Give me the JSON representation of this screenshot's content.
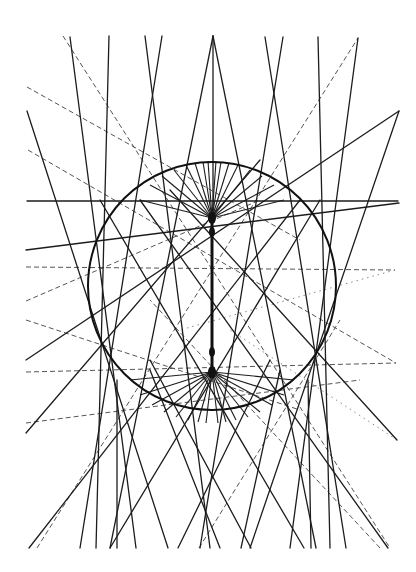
{
  "figure": {
    "colors": {
      "background": "#ffffff",
      "line": "#1c1c1c",
      "dashed_line": "#555555",
      "dotted_line": "#8a8a8a"
    },
    "circle": {
      "cx": 212,
      "cy": 286,
      "r": 124
    },
    "spine": {
      "x": 212,
      "y1": 218,
      "y2": 372
    },
    "nodes": [
      {
        "x": 212,
        "y": 218,
        "r": 4
      },
      {
        "x": 212,
        "y": 232,
        "r": 3
      },
      {
        "x": 212,
        "y": 352,
        "r": 3
      },
      {
        "x": 212,
        "y": 372,
        "r": 4
      }
    ],
    "solid_lines": [
      [
        70,
        37,
        136,
        548
      ],
      [
        109,
        36,
        96,
        548
      ],
      [
        145,
        36,
        210,
        548
      ],
      [
        162,
        36,
        80,
        548
      ],
      [
        213,
        36,
        110,
        548
      ],
      [
        213,
        36,
        316,
        548
      ],
      [
        213,
        36,
        213,
        218
      ],
      [
        265,
        37,
        346,
        548
      ],
      [
        283,
        37,
        200,
        548
      ],
      [
        318,
        37,
        330,
        548
      ],
      [
        358,
        38,
        290,
        548
      ],
      [
        27,
        111,
        168,
        548
      ],
      [
        399,
        111,
        250,
        548
      ],
      [
        27,
        201,
        398,
        201
      ],
      [
        26,
        250,
        399,
        203
      ],
      [
        26,
        360,
        399,
        111
      ],
      [
        26,
        433,
        260,
        160
      ],
      [
        29,
        548,
        300,
        200
      ],
      [
        388,
        548,
        140,
        200
      ],
      [
        397,
        440,
        170,
        190
      ],
      [
        110,
        548,
        320,
        200
      ],
      [
        304,
        548,
        100,
        200
      ],
      [
        117,
        548,
        117,
        380
      ],
      [
        311,
        548,
        308,
        380
      ],
      [
        220,
        548,
        150,
        370
      ],
      [
        241,
        548,
        280,
        370
      ],
      [
        178,
        548,
        270,
        360
      ],
      [
        251,
        548,
        150,
        360
      ]
    ],
    "dashed_lines": [
      [
        63,
        36,
        390,
        548
      ],
      [
        27,
        87,
        300,
        240
      ],
      [
        28,
        150,
        396,
        363
      ],
      [
        26,
        267,
        395,
        270
      ],
      [
        26,
        301,
        260,
        200
      ],
      [
        26,
        320,
        300,
        410
      ],
      [
        26,
        372,
        396,
        363
      ],
      [
        26,
        423,
        360,
        380
      ],
      [
        37,
        548,
        358,
        38
      ],
      [
        380,
        548,
        150,
        300
      ],
      [
        199,
        548,
        340,
        320
      ]
    ],
    "dotted_lines": [
      [
        395,
        270,
        180,
        330
      ],
      [
        397,
        440,
        230,
        330
      ]
    ],
    "top_fan": {
      "origin": [
        212,
        218
      ],
      "targets": [
        [
          140,
          200
        ],
        [
          150,
          185
        ],
        [
          162,
          176
        ],
        [
          174,
          170
        ],
        [
          186,
          165
        ],
        [
          195,
          163
        ],
        [
          203,
          162
        ],
        [
          208,
          161
        ],
        [
          216,
          161
        ],
        [
          221,
          162
        ],
        [
          229,
          163
        ],
        [
          238,
          165
        ],
        [
          250,
          170
        ],
        [
          262,
          176
        ],
        [
          274,
          185
        ],
        [
          284,
          200
        ]
      ]
    },
    "bottom_fan": {
      "origin": [
        212,
        372
      ],
      "targets": [
        [
          130,
          380
        ],
        [
          140,
          395
        ],
        [
          152,
          405
        ],
        [
          164,
          412
        ],
        [
          176,
          417
        ],
        [
          188,
          420
        ],
        [
          198,
          422
        ],
        [
          206,
          423
        ],
        [
          218,
          423
        ],
        [
          226,
          422
        ],
        [
          236,
          420
        ],
        [
          248,
          417
        ],
        [
          260,
          412
        ],
        [
          272,
          405
        ],
        [
          284,
          395
        ],
        [
          294,
          380
        ]
      ]
    }
  }
}
